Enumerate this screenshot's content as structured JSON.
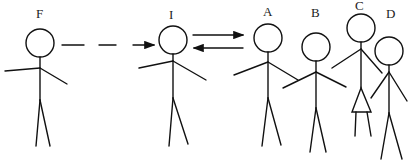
{
  "diagram": {
    "figures": [
      {
        "id": "F",
        "label": "F",
        "cx": 40,
        "cy": 43,
        "r": 14
      },
      {
        "id": "I",
        "label": "I",
        "cx": 173,
        "cy": 40,
        "r": 14
      },
      {
        "id": "A",
        "label": "A",
        "cx": 268,
        "cy": 38,
        "r": 14
      },
      {
        "id": "B",
        "label": "B",
        "cx": 316,
        "cy": 47,
        "r": 14
      },
      {
        "id": "C",
        "label": "C",
        "cx": 361,
        "cy": 28,
        "r": 14
      },
      {
        "id": "D",
        "label": "D",
        "cx": 389,
        "cy": 51,
        "r": 14
      }
    ],
    "arrows": [
      {
        "from": "F",
        "to": "I",
        "style": "dashed"
      },
      {
        "from": "I",
        "to": "A",
        "style": "solid"
      },
      {
        "from": "A",
        "to": "I",
        "style": "solid"
      }
    ],
    "colors": {
      "stroke": "#111111",
      "background": "#ffffff"
    }
  }
}
